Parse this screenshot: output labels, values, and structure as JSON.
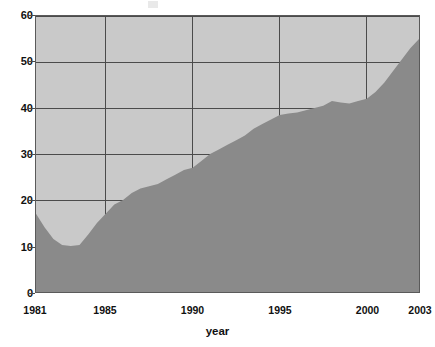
{
  "chart_data": {
    "type": "area",
    "title": "",
    "xlabel": "year",
    "ylabel": "",
    "xlim": [
      1981,
      2003
    ],
    "ylim": [
      0,
      60
    ],
    "grid": true,
    "legend": "none",
    "x_ticks": [
      "1981",
      "1985",
      "1990",
      "1995",
      "2000",
      "2003"
    ],
    "x_tick_values": [
      1981,
      1985,
      1990,
      1995,
      2000,
      2003
    ],
    "y_ticks": [
      "0",
      "10",
      "20",
      "30",
      "40",
      "50",
      "60"
    ],
    "y_tick_values": [
      0,
      10,
      20,
      30,
      40,
      50,
      60
    ],
    "x": [
      1981,
      1981.5,
      1982,
      1982.5,
      1983,
      1983.5,
      1984,
      1984.5,
      1985,
      1985.5,
      1986,
      1986.5,
      1987,
      1987.5,
      1988,
      1988.5,
      1989,
      1989.5,
      1990,
      1990.5,
      1991,
      1991.5,
      1992,
      1992.5,
      1993,
      1993.5,
      1994,
      1994.5,
      1995,
      1995.5,
      1996,
      1996.5,
      1997,
      1997.5,
      1998,
      1998.5,
      1999,
      1999.5,
      2000,
      2000.5,
      2001,
      2001.5,
      2002,
      2002.5,
      2003
    ],
    "values": [
      17.0,
      14.0,
      11.5,
      10.2,
      10.0,
      10.2,
      12.5,
      15.0,
      17.0,
      19.0,
      20.0,
      21.5,
      22.5,
      23.0,
      23.5,
      24.5,
      25.5,
      26.5,
      27.0,
      28.5,
      30.0,
      31.0,
      32.0,
      33.0,
      34.0,
      35.5,
      36.5,
      37.5,
      38.5,
      38.8,
      39.0,
      39.5,
      40.0,
      40.5,
      41.5,
      41.2,
      41.0,
      41.5,
      42.0,
      43.5,
      45.5,
      48.0,
      50.5,
      53.0,
      55.0
    ],
    "series_name": "",
    "colors": {
      "area_fill": "#8a8a8a",
      "background_fill": "#c9c9c9",
      "grid_line": "#4a4a4a",
      "axis_line": "#5a5a5a",
      "text": "#111111"
    }
  }
}
